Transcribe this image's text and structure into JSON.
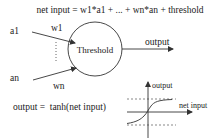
{
  "diagram": {
    "title_formula": "net input = w1*a1 + ... + wn*an + threshold",
    "inputs": [
      {
        "label": "a1",
        "weight": "w1"
      },
      {
        "label": "an",
        "weight": "wn"
      }
    ],
    "neuron_label": "Threshold",
    "output_label": "output",
    "activation_formula": "output =  tanh(net input)",
    "graph": {
      "y_axis_label": "output",
      "x_axis_label": "net input",
      "curve": "tanh"
    },
    "colors": {
      "stroke": "#333333",
      "text": "#222222",
      "background": "#ffffff"
    }
  }
}
